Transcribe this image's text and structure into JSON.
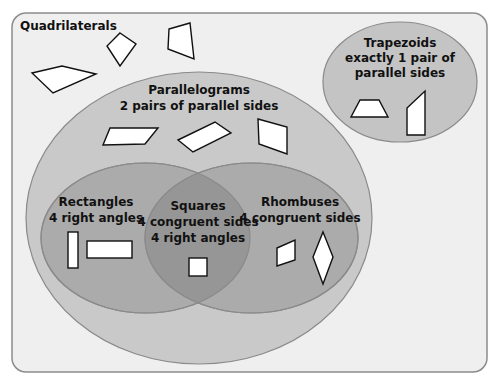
{
  "diagram": {
    "type": "venn",
    "title": "Quadrilaterals",
    "colors": {
      "background": "#efefef",
      "frame_border": "#8c8c8c",
      "parallelograms_fill": "#c9c9c9",
      "trapezoids_fill": "#c4c4c4",
      "inner_fill": "#ababab",
      "intersection_fill": "#969696",
      "ellipse_stroke": "#8a8a8a"
    },
    "sets": {
      "parallelograms": {
        "name": "Parallelograms",
        "property": "2 pairs of parallel sides"
      },
      "trapezoids": {
        "name": "Trapezoids",
        "property_line1": "exactly 1 pair of",
        "property_line2": "parallel sides"
      },
      "rectangles": {
        "name": "Rectangles",
        "property": "4 right angles"
      },
      "rhombuses": {
        "name": "Rhombuses",
        "property": "4 congruent sides"
      },
      "squares": {
        "name": "Squares",
        "property_line1": "4 congruent sides",
        "property_line2": "4 right angles"
      }
    },
    "example_shapes": {
      "quadrilaterals": [
        "irregular quadrilateral",
        "kite",
        "irregular quadrilateral"
      ],
      "parallelograms": [
        "parallelogram",
        "parallelogram",
        "parallelogram"
      ],
      "trapezoids": [
        "isosceles trapezoid",
        "right trapezoid"
      ],
      "rectangles": [
        "tall rectangle",
        "wide rectangle"
      ],
      "squares": [
        "square"
      ],
      "rhombuses": [
        "rhombus",
        "diamond rhombus"
      ]
    }
  }
}
